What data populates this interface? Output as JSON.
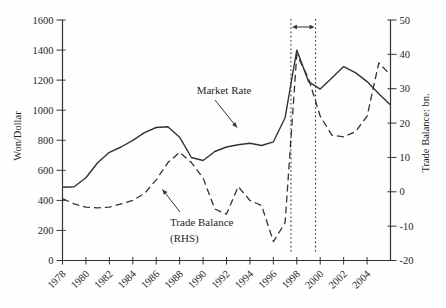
{
  "figure": {
    "left_axis": {
      "label": "Won/Dollar",
      "min": 0,
      "max": 1600,
      "ticks": [
        0,
        200,
        400,
        600,
        800,
        1000,
        1200,
        1400,
        1600
      ]
    },
    "right_axis": {
      "label": "Trade Balance: bn.",
      "min": -20,
      "max": 50,
      "ticks": [
        -20,
        -10,
        0,
        10,
        20,
        30,
        40,
        50
      ]
    },
    "x_axis": {
      "tick_years": [
        1978,
        1980,
        1982,
        1984,
        1986,
        1988,
        1990,
        1992,
        1994,
        1996,
        1998,
        2000,
        2002,
        2004
      ]
    },
    "annotations": {
      "market_rate_label": "Market Rate",
      "trade_balance_label_line1": "Trade Balance",
      "trade_balance_label_line2": "(RHS)",
      "crisis_band": {
        "start_year": 1997.5,
        "end_year": 1999.6
      }
    },
    "colors": {
      "line": "#333333",
      "text": "#1f1f1f",
      "background": "#fefefe"
    }
  },
  "chart_data": {
    "type": "line",
    "title": "",
    "xlabel": "",
    "ylabel_left": "Won/Dollar",
    "ylabel_right": "Trade Balance: bn.",
    "xlim": [
      1978,
      2006
    ],
    "ylim_left": [
      0,
      1600
    ],
    "ylim_right": [
      -20,
      50
    ],
    "grid": false,
    "legend": "inline-annotations",
    "x": [
      1978,
      1979,
      1980,
      1981,
      1982,
      1983,
      1984,
      1985,
      1986,
      1987,
      1988,
      1989,
      1990,
      1991,
      1992,
      1993,
      1994,
      1995,
      1996,
      1997,
      1998,
      1999,
      2000,
      2001,
      2002,
      2003,
      2004,
      2005,
      2006
    ],
    "series": [
      {
        "name": "Market Rate",
        "axis": "left",
        "style": "solid",
        "values": [
          487,
          490,
          550,
          650,
          720,
          755,
          800,
          850,
          885,
          890,
          820,
          685,
          665,
          725,
          755,
          770,
          780,
          765,
          790,
          950,
          1400,
          1190,
          1140,
          1215,
          1290,
          1250,
          1190,
          1110,
          1035
        ]
      },
      {
        "name": "Trade Balance (RHS)",
        "axis": "right",
        "style": "dashed",
        "values": [
          -2,
          -3.5,
          -4.5,
          -4.7,
          -4.5,
          -3.5,
          -2.5,
          -0.5,
          3.5,
          8.5,
          11.5,
          8.5,
          4,
          -5,
          -6.5,
          1.5,
          -2.5,
          -4,
          -14.5,
          -9,
          40,
          33,
          22,
          16.5,
          16,
          17.5,
          22,
          37.5,
          34
        ]
      }
    ]
  }
}
